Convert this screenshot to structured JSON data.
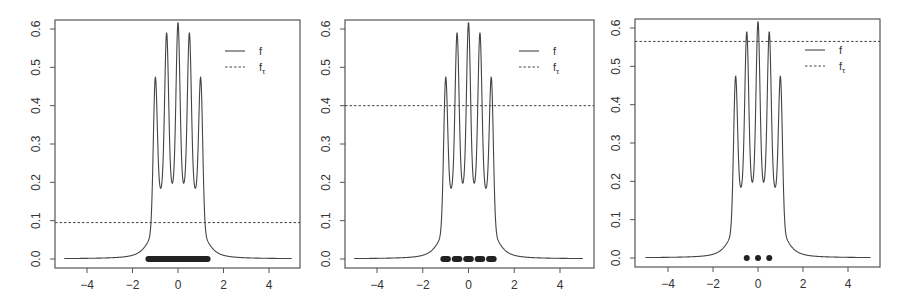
{
  "chart_data": [
    {
      "type": "line",
      "title": "",
      "xlabel": "",
      "ylabel": "",
      "xlim": [
        -5,
        5
      ],
      "ylim": [
        0,
        0.6
      ],
      "x_ticks": [
        -4,
        -2,
        0,
        2,
        4
      ],
      "y_ticks": [
        0.0,
        0.1,
        0.2,
        0.3,
        0.4,
        0.5,
        0.6
      ],
      "grid": false,
      "legend": {
        "position": "top-right",
        "entries": [
          {
            "label": "f",
            "style": "solid"
          },
          {
            "label": "f_τ",
            "style": "dashed"
          }
        ]
      },
      "series": [
        {
          "name": "f",
          "description": "density with 5 peaks",
          "peaks_x": [
            -1.0,
            -0.5,
            0.0,
            0.5,
            1.0
          ],
          "peaks_y": [
            0.52,
            0.575,
            0.6,
            0.575,
            0.52
          ],
          "troughs_x": [
            -0.75,
            -0.25,
            0.25,
            0.75
          ],
          "troughs_y": [
            0.185,
            0.228,
            0.228,
            0.185
          ]
        },
        {
          "name": "f_τ",
          "type": "hline",
          "y": 0.095
        }
      ],
      "level_set": {
        "type": "interval",
        "x": [
          -1.3,
          1.3
        ],
        "y": 0
      }
    },
    {
      "type": "line",
      "title": "",
      "xlabel": "",
      "ylabel": "",
      "xlim": [
        -5,
        5
      ],
      "ylim": [
        0,
        0.6
      ],
      "x_ticks": [
        -4,
        -2,
        0,
        2,
        4
      ],
      "y_ticks": [
        0.0,
        0.1,
        0.2,
        0.3,
        0.4,
        0.5,
        0.6
      ],
      "grid": false,
      "legend": {
        "position": "top-right",
        "entries": [
          {
            "label": "f",
            "style": "solid"
          },
          {
            "label": "f_τ",
            "style": "dashed"
          }
        ]
      },
      "series": [
        {
          "name": "f",
          "description": "density with 5 peaks",
          "peaks_x": [
            -1.0,
            -0.5,
            0.0,
            0.5,
            1.0
          ],
          "peaks_y": [
            0.52,
            0.575,
            0.6,
            0.575,
            0.52
          ],
          "troughs_x": [
            -0.75,
            -0.25,
            0.25,
            0.75
          ],
          "troughs_y": [
            0.185,
            0.228,
            0.228,
            0.185
          ]
        },
        {
          "name": "f_τ",
          "type": "hline",
          "y": 0.4
        }
      ],
      "level_set": {
        "type": "intervals",
        "x": [
          [
            -1.1,
            -0.9
          ],
          [
            -0.6,
            -0.4
          ],
          [
            -0.1,
            0.1
          ],
          [
            0.4,
            0.6
          ],
          [
            0.9,
            1.1
          ]
        ],
        "y": 0
      }
    },
    {
      "type": "line",
      "title": "",
      "xlabel": "",
      "ylabel": "",
      "xlim": [
        -5,
        5
      ],
      "ylim": [
        0,
        0.6
      ],
      "x_ticks": [
        -4,
        -2,
        0,
        2,
        4
      ],
      "y_ticks": [
        0.0,
        0.1,
        0.2,
        0.3,
        0.4,
        0.5,
        0.6
      ],
      "grid": false,
      "legend": {
        "position": "top-right",
        "entries": [
          {
            "label": "f",
            "style": "solid"
          },
          {
            "label": "f_τ",
            "style": "dashed"
          }
        ]
      },
      "series": [
        {
          "name": "f",
          "description": "density with 5 peaks",
          "peaks_x": [
            -1.0,
            -0.5,
            0.0,
            0.5,
            1.0
          ],
          "peaks_y": [
            0.52,
            0.575,
            0.6,
            0.575,
            0.52
          ],
          "troughs_x": [
            -0.75,
            -0.25,
            0.25,
            0.75
          ],
          "troughs_y": [
            0.185,
            0.228,
            0.228,
            0.185
          ]
        },
        {
          "name": "f_τ",
          "type": "hline",
          "y": 0.565
        }
      ],
      "level_set": {
        "type": "points",
        "x": [
          -0.5,
          0.0,
          0.5
        ],
        "y": 0
      }
    }
  ],
  "panels": [
    {
      "frame": {
        "x": 55,
        "y": 20,
        "w": 245,
        "h": 248
      },
      "px": {
        "x0": 87,
        "x4": 269,
        "y0": 259,
        "y6": 29
      },
      "threshold": 0.095,
      "legend_f": "f",
      "legend_ft": "f",
      "legend_ft_sub": "τ",
      "ytick_labels": [
        "0.0",
        "0.1",
        "0.2",
        "0.3",
        "0.4",
        "0.5",
        "0.6"
      ],
      "xtick_labels": [
        "−4",
        "−2",
        "0",
        "2",
        "4"
      ]
    },
    {
      "frame": {
        "x": 345,
        "y": 20,
        "w": 249,
        "h": 248
      },
      "px": {
        "x0": 377,
        "x4": 560,
        "y0": 259,
        "y6": 29
      },
      "threshold": 0.4,
      "legend_f": "f",
      "legend_ft": "f",
      "legend_ft_sub": "τ",
      "ytick_labels": [
        "0.0",
        "0.1",
        "0.2",
        "0.3",
        "0.4",
        "0.5",
        "0.6"
      ],
      "xtick_labels": [
        "−4",
        "−2",
        "0",
        "2",
        "4"
      ]
    },
    {
      "frame": {
        "x": 635,
        "y": 19,
        "w": 245,
        "h": 248
      },
      "px": {
        "x0": 668,
        "x4": 848,
        "y0": 258,
        "y6": 28
      },
      "threshold": 0.565,
      "legend_f": "f",
      "legend_ft": "f",
      "legend_ft_sub": "τ",
      "ytick_labels": [
        "0.0",
        "0.1",
        "0.2",
        "0.3",
        "0.4",
        "0.5",
        "0.6"
      ],
      "xtick_labels": [
        "−4",
        "−2",
        "0",
        "2",
        "4"
      ]
    }
  ],
  "colors": {
    "line": "#444444",
    "frame": "#555555",
    "text": "#333333",
    "marker": "#222222"
  }
}
